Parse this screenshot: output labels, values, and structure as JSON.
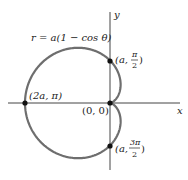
{
  "figure": {
    "equation_label": "r = a(1 − cos θ)",
    "axes": {
      "x_label": "x",
      "y_label": "y"
    },
    "points": [
      {
        "id": "top",
        "label_main": "(a, ",
        "frac_num": "π",
        "frac_den": "2",
        "close": ")"
      },
      {
        "id": "left",
        "label": "(2a, π)"
      },
      {
        "id": "origin",
        "label": "(0, 0)"
      },
      {
        "id": "bottom",
        "label_main": "(a, ",
        "frac_num": "3π",
        "frac_den": "2",
        "close": ")"
      }
    ],
    "colors": {
      "curve": "#6e6e6e",
      "axis": "#444444",
      "point": "#111111"
    }
  }
}
